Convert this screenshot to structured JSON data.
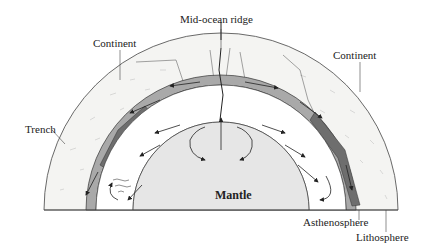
{
  "diagram": {
    "type": "cross-section",
    "labels": {
      "mid_ocean_ridge": "Mid-ocean ridge",
      "continent_left": "Continent",
      "continent_right": "Continent",
      "trench": "Trench",
      "mantle": "Mantle",
      "asthenosphere": "Asthenosphere",
      "lithosphere": "Lithosphere"
    },
    "colors": {
      "background": "#ffffff",
      "outline": "#333333",
      "continent_fill": "#f4f4f2",
      "lithosphere": "#a9a9a9",
      "lithosphere_dark": "#6e6e6e",
      "asthenosphere": "#ffffff",
      "mantle": "#e6e6e6"
    }
  }
}
